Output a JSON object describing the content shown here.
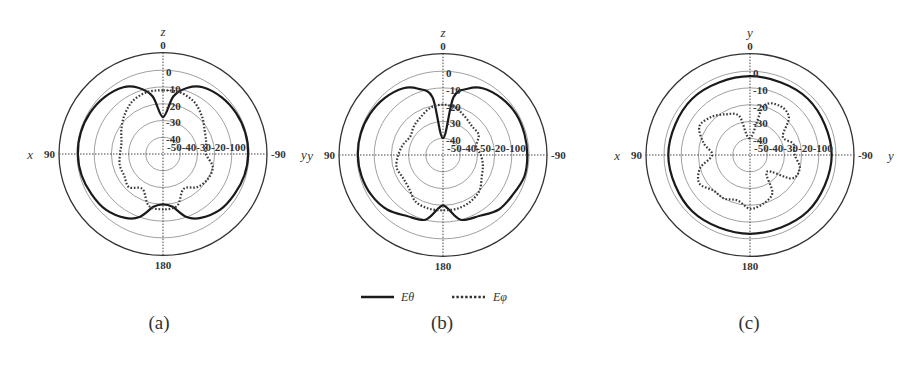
{
  "figure": {
    "legend": {
      "items": [
        {
          "label": "Eθ",
          "style": "solid",
          "color": "#1a1a1a"
        },
        {
          "label": "Eφ",
          "style": "dotted",
          "color": "#333333"
        }
      ]
    },
    "captions": [
      "(a)",
      "(b)",
      "(c)"
    ]
  },
  "chart_data": [
    {
      "type": "polar",
      "id": "a",
      "caption": "(a)",
      "title": "",
      "top_axis_label": "z",
      "left_axis_label": "x",
      "right_axis_label": "y",
      "angle_ticks": {
        "top": "0",
        "left": "90",
        "right": "-90",
        "bottom": "180"
      },
      "radial_ticks": [
        "-50",
        "-40",
        "-30",
        "-20",
        "-10",
        "0"
      ],
      "radial_tick_row": "-50-40-30-20-100",
      "radial_range_db": [
        -50,
        0
      ],
      "grid": true,
      "center": [
        163,
        154
      ],
      "series": [
        {
          "name": "Eθ",
          "style": "solid",
          "angles_deg": [
            0,
            10,
            20,
            30,
            45,
            60,
            75,
            90,
            105,
            120,
            135,
            150,
            160,
            170,
            180,
            190,
            200,
            210,
            225,
            240,
            255,
            270,
            285,
            300,
            315,
            330,
            340,
            350
          ],
          "values_db": [
            -28,
            -15,
            -8,
            -4,
            -2,
            -1,
            -0.5,
            -0.5,
            -1,
            -2,
            -3,
            -6,
            -10,
            -18,
            -20,
            -18,
            -10,
            -6,
            -3,
            -2,
            -1,
            -0.5,
            -0.5,
            -1,
            -2,
            -4,
            -8,
            -15
          ]
        },
        {
          "name": "Eφ",
          "style": "dotted",
          "angles_deg": [
            0,
            15,
            30,
            45,
            60,
            75,
            90,
            105,
            120,
            135,
            150,
            165,
            180,
            195,
            210,
            225,
            240,
            255,
            270,
            285,
            300,
            315,
            330,
            345
          ],
          "values_db": [
            -12,
            -12,
            -14,
            -18,
            -22,
            -25,
            -25,
            -24,
            -24,
            -22,
            -26,
            -18,
            -17,
            -18,
            -26,
            -22,
            -20,
            -20,
            -25,
            -24,
            -22,
            -18,
            -14,
            -12
          ]
        }
      ]
    },
    {
      "type": "polar",
      "id": "b",
      "caption": "(b)",
      "title": "",
      "top_axis_label": "z",
      "left_axis_label": "y",
      "angle_ticks": {
        "top": "0",
        "left": "90",
        "right": "-90",
        "bottom": "180"
      },
      "radial_ticks": [
        "-50",
        "-40",
        "-30",
        "-20",
        "-10",
        "0"
      ],
      "radial_tick_row": "-50-40-50-20-100",
      "radial_range_db": [
        -50,
        0
      ],
      "grid": true,
      "center": [
        443,
        155
      ],
      "series": [
        {
          "name": "Eθ",
          "style": "solid",
          "angles_deg": [
            0,
            10,
            20,
            30,
            45,
            60,
            75,
            90,
            105,
            120,
            135,
            150,
            165,
            175,
            180,
            185,
            195,
            210,
            225,
            240,
            255,
            270,
            285,
            300,
            315,
            330,
            340,
            350
          ],
          "values_db": [
            -40,
            -15,
            -8,
            -4,
            -2,
            -1,
            -0.5,
            -0.5,
            -1,
            -2,
            -4,
            -8,
            -10,
            -18,
            -20,
            -18,
            -10,
            -8,
            -4,
            -3,
            -1,
            -1,
            -1,
            -1,
            -2,
            -4,
            -8,
            -15
          ]
        },
        {
          "name": "Eφ",
          "style": "dotted",
          "angles_deg": [
            0,
            15,
            30,
            45,
            60,
            75,
            90,
            105,
            120,
            135,
            150,
            165,
            180,
            195,
            210,
            225,
            240,
            255,
            270,
            285,
            300,
            315,
            330,
            345
          ],
          "values_db": [
            -20,
            -21,
            -24,
            -26,
            -28,
            -26,
            -24,
            -22,
            -23,
            -22,
            -18,
            -17,
            -17,
            -17,
            -18,
            -20,
            -24,
            -26,
            -28,
            -30,
            -26,
            -26,
            -24,
            -21
          ]
        }
      ]
    },
    {
      "type": "polar",
      "id": "c",
      "caption": "(c)",
      "title": "",
      "top_axis_label": "y",
      "left_axis_label": "x",
      "right_axis_label": "y",
      "angle_ticks": {
        "top": "0",
        "left": "90",
        "right": "-90",
        "bottom": "180"
      },
      "radial_ticks": [
        "-50",
        "-40",
        "-30",
        "-20",
        "-10",
        "0"
      ],
      "radial_tick_row": "-50-40-30-20-100",
      "radial_range_db": [
        -50,
        0
      ],
      "grid": true,
      "center": [
        750,
        155
      ],
      "series": [
        {
          "name": "Eθ",
          "style": "solid",
          "angles_deg": [
            0,
            45,
            90,
            135,
            180,
            225,
            270,
            315
          ],
          "values_db": [
            -3,
            -2.5,
            -2.5,
            -2.5,
            -3,
            -2.5,
            -2.5,
            -2.5
          ]
        },
        {
          "name": "Eφ",
          "style": "dotted",
          "angles_deg": [
            0,
            15,
            30,
            45,
            60,
            75,
            90,
            105,
            120,
            135,
            150,
            165,
            180,
            195,
            210,
            225,
            240,
            255,
            270,
            285,
            300,
            315,
            330,
            345
          ],
          "values_db": [
            -40,
            -26,
            -22,
            -18,
            -16,
            -22,
            -28,
            -20,
            -16,
            -20,
            -20,
            -22,
            -18,
            -20,
            -24,
            -36,
            -22,
            -20,
            -24,
            -24,
            -28,
            -18,
            -16,
            -20
          ]
        }
      ]
    }
  ]
}
